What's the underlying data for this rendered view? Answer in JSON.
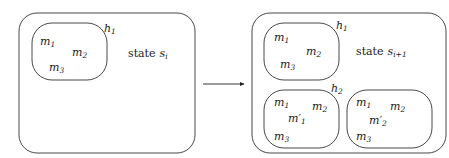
{
  "diagram": {
    "left_state": {
      "label": "state",
      "var": "s",
      "sub": "i",
      "hypotheses": [
        {
          "label": "h",
          "label_sub": "1",
          "members": [
            {
              "base": "m",
              "sub": "1"
            },
            {
              "base": "m",
              "sub": "2"
            },
            {
              "base": "m",
              "sub": "3"
            }
          ]
        }
      ]
    },
    "arrow": {
      "direction": "right"
    },
    "right_state": {
      "label": "state",
      "var": "s",
      "sub": "i+1",
      "hypotheses": [
        {
          "label": "h",
          "label_sub": "1",
          "members": [
            {
              "base": "m",
              "sub": "1"
            },
            {
              "base": "m",
              "sub": "2"
            },
            {
              "base": "m",
              "sub": "3"
            }
          ]
        },
        {
          "label": "h",
          "label_sub": "2",
          "members": [
            {
              "base": "m",
              "sub": "1"
            },
            {
              "base": "m",
              "sub": "2"
            },
            {
              "base": "m′",
              "sub": "1"
            },
            {
              "base": "m",
              "sub": "3"
            }
          ]
        },
        {
          "label": "",
          "label_sub": "",
          "members": [
            {
              "base": "m",
              "sub": "1"
            },
            {
              "base": "m",
              "sub": "2"
            },
            {
              "base": "m′",
              "sub": "2"
            },
            {
              "base": "m",
              "sub": "3"
            }
          ]
        }
      ]
    }
  }
}
